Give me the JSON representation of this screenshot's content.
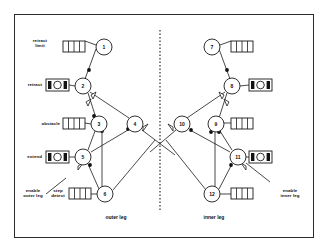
{
  "figure": {
    "type": "petri-net-diagram",
    "frame": {
      "border_color": "#2b2b2b",
      "background": "#ffffff"
    },
    "divider": {
      "name": "leg-separator",
      "style": "dotted-vertical"
    },
    "regions": [
      {
        "id": "outer",
        "label": "outer leg",
        "x": 114,
        "y": 216
      },
      {
        "id": "inner",
        "label": "inner leg",
        "x": 212,
        "y": 216
      }
    ],
    "transitions": [
      {
        "id": "t1",
        "label": "1",
        "cx": 104,
        "cy": 47,
        "r": 8
      },
      {
        "id": "t2",
        "label": "2",
        "cx": 83,
        "cy": 86,
        "r": 8
      },
      {
        "id": "t3",
        "label": "3",
        "cx": 99,
        "cy": 124,
        "r": 8
      },
      {
        "id": "t4",
        "label": "4",
        "cx": 135,
        "cy": 124,
        "r": 8
      },
      {
        "id": "t5",
        "label": "5",
        "cx": 83,
        "cy": 157,
        "r": 8
      },
      {
        "id": "t6",
        "label": "6",
        "cx": 105,
        "cy": 194,
        "r": 8
      },
      {
        "id": "t7",
        "label": "7",
        "cx": 212,
        "cy": 47,
        "r": 8
      },
      {
        "id": "t8",
        "label": "8",
        "cx": 232,
        "cy": 86,
        "r": 8
      },
      {
        "id": "t9",
        "label": "9",
        "cx": 216,
        "cy": 124,
        "r": 8
      },
      {
        "id": "t10",
        "label": "10",
        "cx": 182,
        "cy": 124,
        "r": 8
      },
      {
        "id": "t11",
        "label": "11",
        "cx": 238,
        "cy": 157,
        "r": 8
      },
      {
        "id": "t12",
        "label": "12",
        "cx": 212,
        "cy": 194,
        "r": 8
      }
    ],
    "places": [
      {
        "id": "p1",
        "kind": "buffer",
        "name": "buffer-retract-limit",
        "x": 63,
        "y": 41,
        "w": 22,
        "h": 11
      },
      {
        "id": "p2",
        "kind": "actuator",
        "name": "actuator-retract-outer",
        "x": 46,
        "y": 79,
        "w": 23,
        "h": 12
      },
      {
        "id": "p3",
        "kind": "buffer",
        "name": "buffer-obstacle",
        "x": 63,
        "y": 118,
        "w": 22,
        "h": 11
      },
      {
        "id": "p4",
        "kind": "actuator",
        "name": "actuator-extend-outer",
        "x": 46,
        "y": 151,
        "w": 23,
        "h": 12
      },
      {
        "id": "p5",
        "kind": "buffer",
        "name": "buffer-step-detect",
        "x": 69,
        "y": 188,
        "w": 22,
        "h": 11
      },
      {
        "id": "p6",
        "kind": "buffer",
        "name": "buffer-retract-limit-inner",
        "x": 231,
        "y": 41,
        "w": 22,
        "h": 11
      },
      {
        "id": "p7",
        "kind": "actuator",
        "name": "actuator-retract-inner",
        "x": 249,
        "y": 79,
        "w": 23,
        "h": 12
      },
      {
        "id": "p8",
        "kind": "buffer",
        "name": "buffer-obstacle-inner",
        "x": 231,
        "y": 118,
        "w": 22,
        "h": 11
      },
      {
        "id": "p9",
        "kind": "actuator",
        "name": "actuator-extend-inner",
        "x": 249,
        "y": 151,
        "w": 23,
        "h": 12
      },
      {
        "id": "p10",
        "kind": "buffer",
        "name": "buffer-step-detect-inner",
        "x": 231,
        "y": 188,
        "w": 22,
        "h": 11
      }
    ],
    "labels": [
      {
        "id": "lab-retract-limit",
        "text": "retract\nlimit",
        "x": 30,
        "y": 39,
        "align": "center"
      },
      {
        "id": "lab-retract",
        "text": "retract",
        "x": 17,
        "y": 81,
        "align": "right"
      },
      {
        "id": "lab-obstacle",
        "text": "obstacle",
        "x": 22,
        "y": 120,
        "align": "right"
      },
      {
        "id": "lab-extend",
        "text": "extend",
        "x": 20,
        "y": 153,
        "align": "right"
      },
      {
        "id": "lab-enable-outer",
        "text": "enable\nouter leg",
        "x": 18,
        "y": 188,
        "align": "center"
      },
      {
        "id": "lab-step-detect",
        "text": "step\ndetect",
        "x": 51,
        "y": 188,
        "align": "center"
      },
      {
        "id": "lab-enable-inner",
        "text": "enable\ninner leg",
        "x": 277,
        "y": 188,
        "align": "center"
      }
    ]
  }
}
